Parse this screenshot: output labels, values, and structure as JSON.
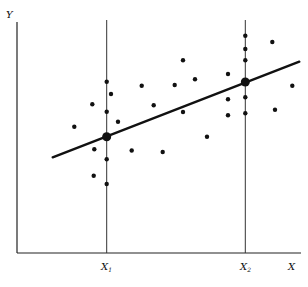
{
  "chart_data": {
    "type": "scatter",
    "title": "",
    "xlabel": "X",
    "ylabel": "Y",
    "x_tick_labels": [
      {
        "label": "X",
        "sub": "1",
        "x": 106.7
      },
      {
        "label": "X",
        "sub": "2",
        "x": 245.3
      }
    ],
    "grid": false,
    "legend": null,
    "axes": {
      "origin": [
        17,
        253
      ],
      "x_end": 301,
      "y_top": 22
    },
    "vertical_guides": [
      {
        "x": 106.7,
        "y_top": 20
      },
      {
        "x": 245.3,
        "y_top": 20
      }
    ],
    "regression_line": {
      "x1": 52.7,
      "y1": 157.3,
      "x2": 299.3,
      "y2": 61.7
    },
    "conditional_means": [
      {
        "name": "mean at X1",
        "x": 106.7,
        "y": 136.7
      },
      {
        "name": "mean at X2",
        "x": 245.3,
        "y": 82
      }
    ],
    "points": [
      {
        "x": 106.7,
        "y": 81.7
      },
      {
        "x": 111,
        "y": 94
      },
      {
        "x": 106.7,
        "y": 111.7
      },
      {
        "x": 106.7,
        "y": 159.3
      },
      {
        "x": 106.7,
        "y": 184
      },
      {
        "x": 92.3,
        "y": 104.3
      },
      {
        "x": 118,
        "y": 121.7
      },
      {
        "x": 74.3,
        "y": 126.7
      },
      {
        "x": 94.3,
        "y": 149.3
      },
      {
        "x": 93.7,
        "y": 175.7
      },
      {
        "x": 131.7,
        "y": 150.5
      },
      {
        "x": 141.7,
        "y": 85.7
      },
      {
        "x": 153.7,
        "y": 105.3
      },
      {
        "x": 162.7,
        "y": 152
      },
      {
        "x": 174.7,
        "y": 85
      },
      {
        "x": 183,
        "y": 60.3
      },
      {
        "x": 183,
        "y": 112
      },
      {
        "x": 195,
        "y": 79.3
      },
      {
        "x": 207,
        "y": 136.7
      },
      {
        "x": 228,
        "y": 74
      },
      {
        "x": 228,
        "y": 99.3
      },
      {
        "x": 228,
        "y": 115.3
      },
      {
        "x": 245.3,
        "y": 35.7
      },
      {
        "x": 245.3,
        "y": 49
      },
      {
        "x": 245.3,
        "y": 60.3
      },
      {
        "x": 245.3,
        "y": 97.3
      },
      {
        "x": 245.3,
        "y": 113.3
      },
      {
        "x": 272.3,
        "y": 42
      },
      {
        "x": 275,
        "y": 109.7
      },
      {
        "x": 292.3,
        "y": 85.7
      }
    ],
    "colors": {
      "ink": "#111111",
      "background": "#ffffff"
    }
  },
  "labels": {
    "y_axis": "Y",
    "x_axis": "X",
    "x1_main": "X",
    "x1_sub": "1",
    "x2_main": "X",
    "x2_sub": "2"
  }
}
